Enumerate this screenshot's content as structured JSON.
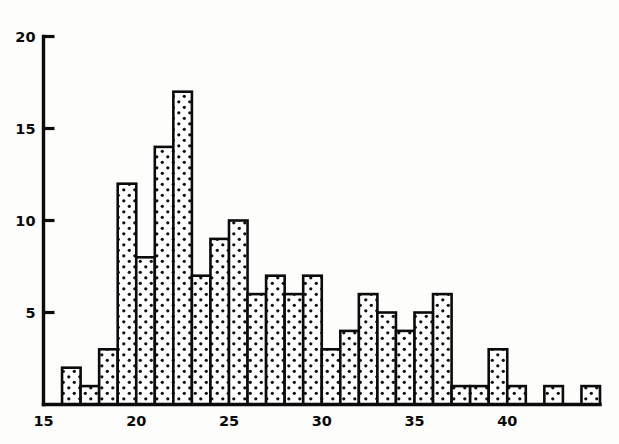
{
  "chart_data": {
    "type": "bar",
    "title": "",
    "subtitle": "",
    "xlabel": "",
    "ylabel": "",
    "xlim": [
      15,
      45
    ],
    "ylim": [
      0,
      20
    ],
    "grid": false,
    "legend": null,
    "bin_width": 1,
    "x_ticks": [
      15,
      20,
      25,
      30,
      35,
      40
    ],
    "x_tick_labels": [
      "15",
      "20",
      "25",
      "30",
      "35",
      "40"
    ],
    "y_ticks": [
      5,
      10,
      15,
      20
    ],
    "y_tick_labels": [
      "5",
      "10",
      "15",
      "20"
    ],
    "categories": [
      16,
      17,
      18,
      19,
      20,
      21,
      22,
      23,
      24,
      25,
      26,
      27,
      28,
      29,
      30,
      31,
      32,
      33,
      34,
      35,
      36,
      37,
      38,
      39,
      40,
      41,
      42,
      43,
      44
    ],
    "values": [
      2,
      1,
      3,
      12,
      8,
      14,
      17,
      7,
      9,
      10,
      6,
      7,
      6,
      7,
      3,
      4,
      6,
      5,
      4,
      5,
      6,
      1,
      1,
      3,
      1,
      0,
      1,
      0,
      1
    ],
    "bar_fill_pattern": "stipple-dots",
    "bar_fill_color": "#ffffff",
    "bar_dot_color": "#111111",
    "bar_edge_color": "#0b0b0b",
    "axis_color": "#0b0b0b",
    "background_color": "#fdfdfb"
  }
}
